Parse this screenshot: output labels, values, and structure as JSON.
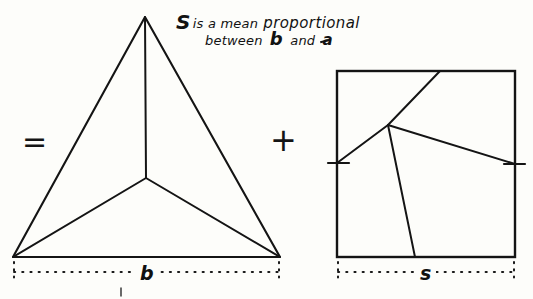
{
  "page": {
    "background_color": "#fdfdfa",
    "ink_color": "#141414",
    "width": 533,
    "height": 299,
    "kind": "hand-drawn geometric construction plate"
  },
  "annotation": {
    "line1_lead": "S",
    "line1_rest": "is a mean",
    "line1_tail": "proportional",
    "line2_lead": "between",
    "line2_var": "b",
    "line2_mid": "and",
    "line2_frac": "a",
    "full_text": "S is a mean proportional between b and ½a"
  },
  "operators": {
    "equals": "=",
    "plus": "+"
  },
  "figures": {
    "triangle": {
      "name": "subdivided triangle",
      "apex": [
        145,
        17
      ],
      "bottom_left": [
        13,
        257
      ],
      "bottom_right": [
        280,
        257
      ],
      "center": [
        146,
        178
      ],
      "spokes": [
        "apex",
        "bottom_left",
        "bottom_right"
      ],
      "dimension_label": "b",
      "dimension_span": [
        13,
        280
      ],
      "dimension_y": 272
    },
    "square": {
      "name": "subdivided square",
      "left": 337,
      "top": 71,
      "right": 515,
      "bottom": 257,
      "interior_point": [
        388,
        125
      ],
      "top_edge_hit": [
        440,
        71
      ],
      "left_tick_hit": [
        337,
        163
      ],
      "right_tick_hit": [
        515,
        164
      ],
      "bottom_edge_hit": [
        415,
        257
      ],
      "tick_marks": [
        {
          "side": "left",
          "y": 163
        },
        {
          "side": "right",
          "y": 164
        }
      ],
      "dimension_label": "s",
      "dimension_span": [
        337,
        515
      ],
      "dimension_y": 272
    }
  },
  "colors": {
    "ink": "#141414",
    "paper": "#fdfdfa",
    "dotted": "#1a1a1a"
  }
}
